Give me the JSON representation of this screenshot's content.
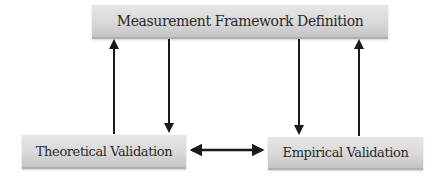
{
  "diagram": {
    "nodes": {
      "top": {
        "label": "Measurement Framework Definition"
      },
      "left": {
        "label": "Theoretical Validation"
      },
      "right": {
        "label": "Empirical Validation"
      }
    },
    "edges": [
      {
        "from": "Theoretical Validation",
        "to": "Measurement Framework Definition",
        "direction": "up"
      },
      {
        "from": "Measurement Framework Definition",
        "to": "Theoretical Validation",
        "direction": "down"
      },
      {
        "from": "Measurement Framework Definition",
        "to": "Empirical Validation",
        "direction": "down"
      },
      {
        "from": "Empirical Validation",
        "to": "Measurement Framework Definition",
        "direction": "up"
      },
      {
        "from": "Theoretical Validation",
        "to": "Empirical Validation",
        "direction": "bidirectional"
      }
    ],
    "colors": {
      "box_fill": "#d9d9d9",
      "arrow": "#1a1a1a",
      "text": "#2a2a2a"
    }
  }
}
